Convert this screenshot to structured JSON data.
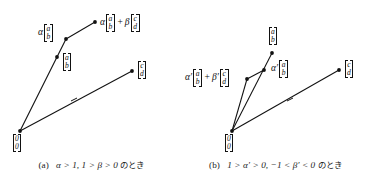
{
  "figure": {
    "kind": "vector-addition-diagram",
    "background_color": "#ffffff",
    "ink_color": "#111111"
  },
  "panels": [
    {
      "id": "a",
      "caption": {
        "label": "(a)",
        "math": "α > 1,  1 > β > 0",
        "suffix": "のとき",
        "full": "(a)  α > 1,  1 > β > 0 のとき"
      },
      "points": [
        {
          "name": "origin",
          "x": 20,
          "y": 131
        },
        {
          "name": "a-vector-tip",
          "x": 57,
          "y": 57
        },
        {
          "name": "alpha-a-tip",
          "x": 66,
          "y": 39
        },
        {
          "name": "sum-tip",
          "x": 95,
          "y": 22
        },
        {
          "name": "c-vector-tip",
          "x": 132,
          "y": 71
        }
      ],
      "labels": [
        {
          "name": "origin-label",
          "x": 14,
          "y": 136,
          "scalar": "",
          "op": "",
          "vectors": [
            {
              "top": "0",
              "bottom": "0"
            }
          ]
        },
        {
          "name": "a-vector-label",
          "x": 63,
          "y": 57,
          "scalar": "",
          "op": "",
          "vectors": [
            {
              "top": "a",
              "bottom": "b"
            }
          ]
        },
        {
          "name": "alpha-a-label",
          "x": 40,
          "y": 27,
          "scalar": "α",
          "op": "",
          "vectors": [
            {
              "top": "a",
              "bottom": "b"
            }
          ]
        },
        {
          "name": "sum-label",
          "x": 100,
          "y": 16,
          "scalar": "α",
          "op": "+",
          "scalar2": "β",
          "vectors": [
            {
              "top": "a",
              "bottom": "b"
            },
            {
              "top": "c",
              "bottom": "d"
            }
          ]
        },
        {
          "name": "c-vector-label",
          "x": 137,
          "y": 64,
          "scalar": "",
          "op": "",
          "vectors": [
            {
              "top": "c",
              "bottom": "d"
            }
          ]
        }
      ]
    },
    {
      "id": "b",
      "caption": {
        "label": "(b)",
        "math": "1 > α′ > 0,  −1 < β′ < 0",
        "suffix": "のとき",
        "full": "(b)  1 > α′ > 0,  −1 < β′ < 0 のとき"
      },
      "points": [
        {
          "name": "origin",
          "x": 48,
          "y": 131
        },
        {
          "name": "a-vector-tip",
          "x": 88,
          "y": 53
        },
        {
          "name": "alpha-a-tip",
          "x": 80,
          "y": 70
        },
        {
          "name": "sum-tip",
          "x": 63,
          "y": 79
        },
        {
          "name": "c-vector-tip",
          "x": 155,
          "y": 70
        }
      ],
      "labels": [
        {
          "name": "origin-label",
          "x": 42,
          "y": 136,
          "scalar": "",
          "op": "",
          "vectors": [
            {
              "top": "0",
              "bottom": "0"
            }
          ]
        },
        {
          "name": "a-vector-label",
          "x": 84,
          "y": 28,
          "scalar": "",
          "op": "",
          "vectors": [
            {
              "top": "a",
              "bottom": "b"
            }
          ]
        },
        {
          "name": "alpha-a-label",
          "x": 92,
          "y": 63,
          "scalar": "α′",
          "op": "",
          "vectors": [
            {
              "top": "a",
              "bottom": "b"
            }
          ]
        },
        {
          "name": "sum-label",
          "x": 3,
          "y": 72,
          "scalar": "α′",
          "op": "+",
          "scalar2": "β′",
          "vectors": [
            {
              "top": "a",
              "bottom": "b"
            },
            {
              "top": "c",
              "bottom": "d"
            }
          ]
        },
        {
          "name": "c-vector-label",
          "x": 160,
          "y": 63,
          "scalar": "",
          "op": "",
          "vectors": [
            {
              "top": "c",
              "bottom": "d"
            }
          ]
        }
      ]
    }
  ]
}
